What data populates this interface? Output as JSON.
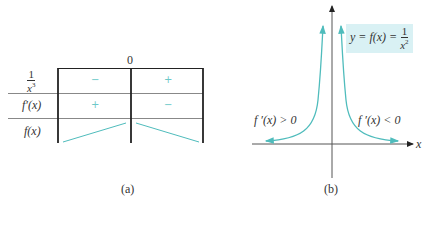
{
  "panel_a": {
    "caption": "(a)",
    "critical_point_label": "0",
    "rows": [
      {
        "label_num": "1",
        "label_den": "x",
        "label_den_exp": "3",
        "signs": [
          "−",
          "+"
        ]
      },
      {
        "label": "f′(x)",
        "signs": [
          "+",
          "−"
        ]
      },
      {
        "label": "f(x)",
        "behavior": [
          "increasing",
          "decreasing"
        ]
      }
    ]
  },
  "panel_b": {
    "caption": "(b)",
    "equation": {
      "lhs": "y = f(x) =",
      "num": "1",
      "den": "x",
      "den_exp": "2"
    },
    "left_annotation": "f ′(x) > 0",
    "right_annotation": "f ′(x) < 0",
    "x_axis_label": "x"
  },
  "colors": {
    "curve": "#4fbcbc",
    "sign_text": "#6cc8c8",
    "equation_bg": "#d9f1f4",
    "axis": "#444444",
    "table_lines": "#222222"
  }
}
